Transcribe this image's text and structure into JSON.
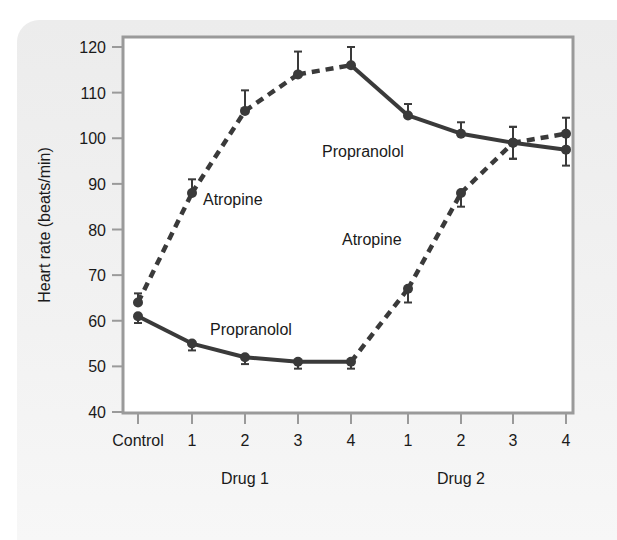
{
  "chart_data": {
    "type": "line",
    "title": "",
    "xlabel_groups": [
      "Drug 1",
      "Drug 2"
    ],
    "ylabel": "Heart rate (beats/min)",
    "ylim": [
      40,
      120
    ],
    "yticks": [
      40,
      50,
      60,
      70,
      80,
      90,
      100,
      110,
      120
    ],
    "categories": [
      "Control",
      "1",
      "2",
      "3",
      "4",
      "1",
      "2",
      "3",
      "4"
    ],
    "grid": false,
    "legend": "inline labels",
    "series": [
      {
        "name": "Atropine (Drug 1) then Propranolol (Drug 2)",
        "values": [
          64,
          88,
          106,
          114,
          116,
          105,
          101,
          99,
          97.5
        ],
        "errors": [
          2,
          3,
          4.5,
          5,
          4,
          2.5,
          2.5,
          3.5,
          3.5
        ],
        "segment_styles": [
          "dashed",
          "dashed",
          "dashed",
          "dashed",
          "solid",
          "solid",
          "solid",
          "solid"
        ]
      },
      {
        "name": "Propranolol (Drug 1) then Atropine (Drug 2)",
        "values": [
          61,
          55,
          52,
          51,
          51,
          67,
          88,
          99,
          101
        ],
        "errors": [
          1.5,
          1.5,
          1.5,
          1.5,
          1.5,
          3,
          3,
          3.5,
          3.5
        ],
        "segment_styles": [
          "solid",
          "solid",
          "solid",
          "solid",
          "dashed",
          "dashed",
          "dashed",
          "dashed"
        ]
      }
    ],
    "annotations": [
      {
        "text": "Atropine",
        "near": "Drug 1 dose 1, upper curve"
      },
      {
        "text": "Propranolol",
        "near": "Drug 2, upper curve"
      },
      {
        "text": "Propranolol",
        "near": "Drug 1, lower curve"
      },
      {
        "text": "Atropine",
        "near": "Drug 2, rising curve"
      }
    ]
  },
  "labels": {
    "ylabel": "Heart rate (beats/min)",
    "group1": "Drug 1",
    "group2": "Drug 2",
    "anno_atropine_1": "Atropine",
    "anno_propranolol_1": "Propranolol",
    "anno_propranolol_2": "Propranolol",
    "anno_atropine_2": "Atropine"
  },
  "colors": {
    "line": "#3a3a3a",
    "frame": "#9a9a9a",
    "panel": "#eeeeee"
  }
}
